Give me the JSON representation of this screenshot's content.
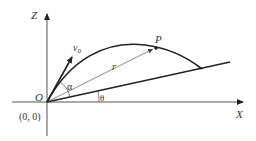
{
  "diagram": {
    "labels": {
      "z_axis": "Z",
      "x_axis": "X",
      "origin": "O",
      "origin_coords": "(0, 0)",
      "velocity": "v",
      "velocity_sub": "0",
      "point": "P",
      "radius": "r",
      "alpha": "α",
      "theta": "θ"
    },
    "colors": {
      "stroke": "#222222",
      "thin_stroke": "#555555",
      "text": "#333333"
    }
  }
}
